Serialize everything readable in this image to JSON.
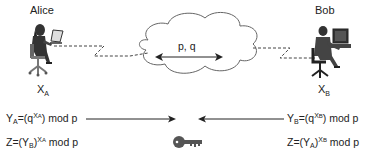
{
  "parties": {
    "alice": {
      "name": "Alice",
      "secret_base": "X",
      "secret_sub": "A"
    },
    "bob": {
      "name": "Bob",
      "secret_base": "X",
      "secret_sub": "B"
    }
  },
  "cloud": {
    "label": "p, q"
  },
  "equations": {
    "alice_public": {
      "lhs_base": "Y",
      "lhs_sub": "A",
      "mid": "=(q",
      "sup_base": "X",
      "sup_sub": "A",
      "tail": ") mod p"
    },
    "alice_shared": {
      "pre": "Z=(Y",
      "sub": "B",
      "close": ")",
      "sup_base": "X",
      "sup_sub": "A",
      "tail": " mod p"
    },
    "bob_public": {
      "lhs_base": "Y",
      "lhs_sub": "B",
      "mid": "=(q",
      "sup_base": "X",
      "sup_sub": "B",
      "tail": ") mod p"
    },
    "bob_shared": {
      "pre": "Z=(Y",
      "sub": "A",
      "close": ")",
      "sup_base": "X",
      "sup_sub": "B",
      "tail": " mod p"
    }
  },
  "icons": [
    "person-at-laptop-icon",
    "person-at-computer-icon",
    "cloud-icon",
    "key-icon",
    "arrow-right-icon",
    "arrow-left-icon",
    "double-arrow-icon"
  ],
  "colors": {
    "line": "#333333",
    "cloud_stroke": "#555555",
    "key": "#555555"
  }
}
